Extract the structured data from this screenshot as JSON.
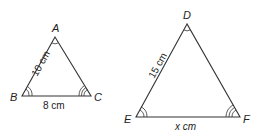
{
  "triangles": [
    {
      "name": "ABC",
      "vertices": {
        "A": "A",
        "B": "B",
        "C": "C"
      },
      "sides": {
        "AB": "10 cm",
        "BC": "8 cm"
      },
      "angle_marks": {
        "A": 1,
        "B": 2,
        "C": 3
      }
    },
    {
      "name": "DEF",
      "vertices": {
        "D": "D",
        "E": "E",
        "F": "F"
      },
      "sides": {
        "DE": "15 cm",
        "EF": "x cm"
      },
      "angle_marks": {
        "D": 1,
        "E": 2,
        "F": 3
      }
    }
  ]
}
